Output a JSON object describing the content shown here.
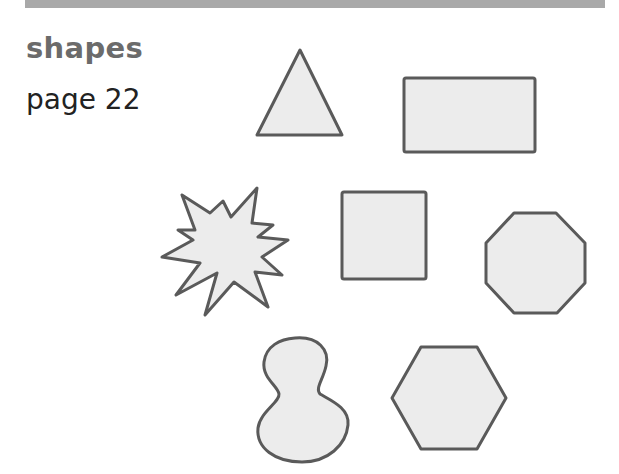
{
  "header": {
    "title": "shapes",
    "page_label": "page 22"
  },
  "colors": {
    "bar": "#a9a9a9",
    "title": "#6b6b6b",
    "subtitle": "#222222",
    "shape_fill": "#ececec",
    "shape_stroke": "#5a5a5a"
  },
  "shapes": [
    {
      "name": "triangle"
    },
    {
      "name": "rectangle"
    },
    {
      "name": "star"
    },
    {
      "name": "square"
    },
    {
      "name": "octagon"
    },
    {
      "name": "blob"
    },
    {
      "name": "hexagon"
    }
  ]
}
